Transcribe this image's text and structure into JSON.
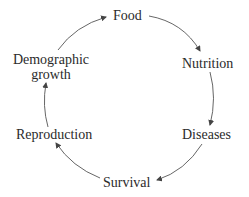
{
  "diagram": {
    "type": "cycle",
    "nodes": [
      {
        "id": "food",
        "label": "Food"
      },
      {
        "id": "nutrition",
        "label": "Nutrition"
      },
      {
        "id": "diseases",
        "label": "Diseases"
      },
      {
        "id": "survival",
        "label": "Survival"
      },
      {
        "id": "reproduction",
        "label": "Reproduction"
      },
      {
        "id": "demographic_growth",
        "label_line1": "Demographic",
        "label_line2": "growth"
      }
    ],
    "edges": [
      {
        "from": "Food",
        "to": "Nutrition"
      },
      {
        "from": "Nutrition",
        "to": "Diseases"
      },
      {
        "from": "Diseases",
        "to": "Survival"
      },
      {
        "from": "Survival",
        "to": "Reproduction"
      },
      {
        "from": "Reproduction",
        "to": "Demographic growth"
      },
      {
        "from": "Demographic growth",
        "to": "Food"
      }
    ],
    "colors": {
      "text": "#2b2b2b",
      "arrow": "#444444",
      "background": "#ffffff"
    }
  }
}
